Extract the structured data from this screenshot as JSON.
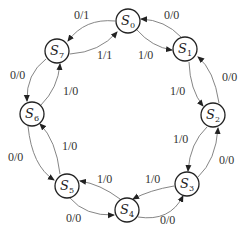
{
  "diagram": {
    "type": "state-machine",
    "states": [
      {
        "id": "S0",
        "name": "S",
        "sub": "0",
        "cx": 128,
        "cy": 21
      },
      {
        "id": "S1",
        "name": "S",
        "sub": "1",
        "cx": 185,
        "cy": 49
      },
      {
        "id": "S2",
        "name": "S",
        "sub": "2",
        "cx": 213,
        "cy": 115
      },
      {
        "id": "S3",
        "name": "S",
        "sub": "3",
        "cx": 187,
        "cy": 184
      },
      {
        "id": "S4",
        "name": "S",
        "sub": "4",
        "cx": 127,
        "cy": 210
      },
      {
        "id": "S5",
        "name": "S",
        "sub": "5",
        "cx": 67,
        "cy": 186
      },
      {
        "id": "S6",
        "name": "S",
        "sub": "6",
        "cx": 32,
        "cy": 114
      },
      {
        "id": "S7",
        "name": "S",
        "sub": "7",
        "cx": 57,
        "cy": 51
      }
    ],
    "transitions": [
      {
        "from": "S0",
        "to": "S1",
        "label": "1/0"
      },
      {
        "from": "S1",
        "to": "S0",
        "label": "0/0"
      },
      {
        "from": "S1",
        "to": "S2",
        "label": "1/0"
      },
      {
        "from": "S2",
        "to": "S1",
        "label": "0/0"
      },
      {
        "from": "S2",
        "to": "S3",
        "label": "1/0"
      },
      {
        "from": "S3",
        "to": "S2",
        "label": "0/0"
      },
      {
        "from": "S3",
        "to": "S4",
        "label": "1/0"
      },
      {
        "from": "S4",
        "to": "S3",
        "label": "0/0"
      },
      {
        "from": "S4",
        "to": "S5",
        "label": "1/0"
      },
      {
        "from": "S5",
        "to": "S4",
        "label": "0/0"
      },
      {
        "from": "S5",
        "to": "S6",
        "label": "1/0"
      },
      {
        "from": "S6",
        "to": "S5",
        "label": "0/0"
      },
      {
        "from": "S6",
        "to": "S7",
        "label": "1/0"
      },
      {
        "from": "S7",
        "to": "S6",
        "label": "0/0"
      },
      {
        "from": "S7",
        "to": "S0",
        "label": "1/1"
      },
      {
        "from": "S0",
        "to": "S7",
        "label": "0/1"
      }
    ]
  }
}
